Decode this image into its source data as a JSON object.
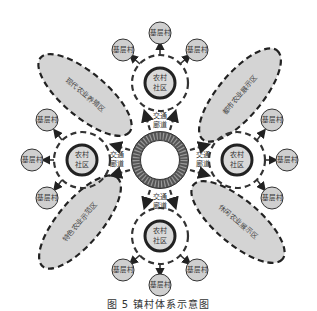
{
  "title": "镇村体系示意图",
  "caption": "图 5   镇村体系示意图",
  "colors": {
    "zone_fill": "#d4d4d4",
    "node_fill": "#cfcfcf",
    "stroke": "#222222",
    "hub": "#666666",
    "text": "#333333"
  },
  "center_hub": {
    "label": ""
  },
  "corridor_label_line1": "交通",
  "corridor_label_line2": "廊道",
  "communities": [
    {
      "id": "top",
      "line1": "农村",
      "line2": "社区"
    },
    {
      "id": "left",
      "line1": "农村",
      "line2": "社区"
    },
    {
      "id": "right",
      "line1": "农村",
      "line2": "社区"
    },
    {
      "id": "bottom",
      "line1": "农村",
      "line2": "社区"
    }
  ],
  "village_label": "基层村",
  "zones": [
    {
      "id": "top-left",
      "label": "现代农业养殖区"
    },
    {
      "id": "top-right",
      "label": "都市农业展示区"
    },
    {
      "id": "bottom-left",
      "label": "特色农业示范区"
    },
    {
      "id": "bottom-right",
      "label": "休闲农业展示区"
    }
  ]
}
